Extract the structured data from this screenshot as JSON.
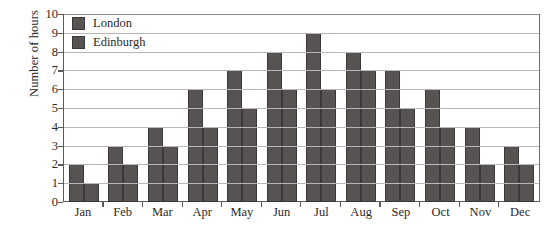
{
  "chart_data": {
    "type": "bar",
    "title": "",
    "xlabel": "",
    "ylabel": "Number of hours",
    "ylim": [
      0,
      10
    ],
    "ytick_labels": [
      "10",
      "9",
      "8",
      "7",
      "6",
      "5",
      "4",
      "3",
      "2",
      "1",
      "0"
    ],
    "grid": true,
    "legend_position": "top-left-inside",
    "categories": [
      "Jan",
      "Feb",
      "Mar",
      "Apr",
      "May",
      "Jun",
      "Jul",
      "Aug",
      "Sep",
      "Oct",
      "Nov",
      "Dec"
    ],
    "series": [
      {
        "name": "London",
        "color": "#565352",
        "values": [
          2,
          3,
          4,
          6,
          7,
          8,
          9,
          8,
          7,
          6,
          4,
          3
        ]
      },
      {
        "name": "Edinburgh",
        "color": "#565352",
        "values": [
          1,
          2,
          3,
          4,
          5,
          6,
          6,
          7,
          5,
          4,
          2,
          2
        ]
      }
    ]
  },
  "legend": {
    "items": [
      {
        "label": "London",
        "swatch_name": "legend-swatch-london"
      },
      {
        "label": "Edinburgh",
        "swatch_name": "legend-swatch-edinburgh"
      }
    ]
  }
}
